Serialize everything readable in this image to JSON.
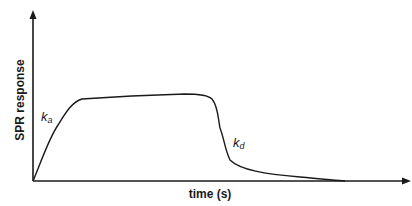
{
  "diagram": {
    "type": "SPR sensorgram schematic",
    "y_axis": {
      "label": "SPR response"
    },
    "x_axis": {
      "label": "time (s)"
    },
    "annotations": [
      {
        "id": "association",
        "symbol": "k",
        "subscript": "a"
      },
      {
        "id": "dissociation",
        "symbol": "k",
        "subscript": "d"
      }
    ],
    "colors": {
      "line": "#1a1a1a",
      "background": "#ffffff"
    }
  }
}
